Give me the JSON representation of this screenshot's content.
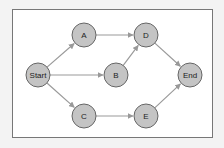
{
  "diagram": {
    "type": "directed-graph",
    "frame": {
      "x": 12,
      "y": 9,
      "width": 200,
      "height": 128,
      "fill": "#ffffff",
      "stroke": "#777777"
    },
    "style": {
      "node_fill": "#c4c4c4",
      "node_stroke": "#666666",
      "edge_color": "#999999",
      "label_color": "#222222",
      "node_radius": 12
    },
    "nodes": [
      {
        "id": "start",
        "label": "Start",
        "x": 38,
        "y": 75
      },
      {
        "id": "a",
        "label": "A",
        "x": 84,
        "y": 35
      },
      {
        "id": "b",
        "label": "B",
        "x": 116,
        "y": 75
      },
      {
        "id": "c",
        "label": "C",
        "x": 84,
        "y": 116
      },
      {
        "id": "d",
        "label": "D",
        "x": 146,
        "y": 35
      },
      {
        "id": "e",
        "label": "E",
        "x": 146,
        "y": 116
      },
      {
        "id": "end",
        "label": "End",
        "x": 190,
        "y": 75
      }
    ],
    "edges": [
      {
        "from": "start",
        "to": "a"
      },
      {
        "from": "start",
        "to": "b"
      },
      {
        "from": "start",
        "to": "c"
      },
      {
        "from": "a",
        "to": "d"
      },
      {
        "from": "b",
        "to": "d"
      },
      {
        "from": "c",
        "to": "e"
      },
      {
        "from": "d",
        "to": "end"
      },
      {
        "from": "e",
        "to": "end"
      }
    ]
  }
}
